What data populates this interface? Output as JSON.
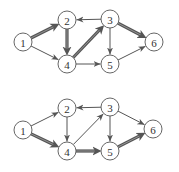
{
  "node_radius": 9,
  "colors": {
    "stroke": "#555555",
    "text": "#333333",
    "background": "#ffffff"
  },
  "graphs": [
    {
      "id": "top",
      "nodes": [
        {
          "id": "1",
          "label": "1",
          "x": 23,
          "y": 42
        },
        {
          "id": "2",
          "label": "2",
          "x": 67,
          "y": 20
        },
        {
          "id": "3",
          "label": "3",
          "x": 110,
          "y": 19
        },
        {
          "id": "4",
          "label": "4",
          "x": 67,
          "y": 64
        },
        {
          "id": "5",
          "label": "5",
          "x": 110,
          "y": 64
        },
        {
          "id": "6",
          "label": "6",
          "x": 154,
          "y": 42
        }
      ],
      "edges": [
        {
          "from": "1",
          "to": "2",
          "highlighted": true
        },
        {
          "from": "1",
          "to": "4",
          "highlighted": false
        },
        {
          "from": "2",
          "to": "4",
          "highlighted": true
        },
        {
          "from": "3",
          "to": "2",
          "highlighted": false
        },
        {
          "from": "4",
          "to": "3",
          "highlighted": true
        },
        {
          "from": "3",
          "to": "5",
          "highlighted": false
        },
        {
          "from": "3",
          "to": "6",
          "highlighted": true
        },
        {
          "from": "4",
          "to": "5",
          "highlighted": false
        },
        {
          "from": "5",
          "to": "6",
          "highlighted": false
        }
      ]
    },
    {
      "id": "bottom",
      "nodes": [
        {
          "id": "1",
          "label": "1",
          "x": 23,
          "y": 130
        },
        {
          "id": "2",
          "label": "2",
          "x": 67,
          "y": 108
        },
        {
          "id": "3",
          "label": "3",
          "x": 110,
          "y": 107
        },
        {
          "id": "4",
          "label": "4",
          "x": 67,
          "y": 151
        },
        {
          "id": "5",
          "label": "5",
          "x": 110,
          "y": 151
        },
        {
          "id": "6",
          "label": "6",
          "x": 153,
          "y": 129
        }
      ],
      "edges": [
        {
          "from": "1",
          "to": "2",
          "highlighted": false
        },
        {
          "from": "1",
          "to": "4",
          "highlighted": true
        },
        {
          "from": "2",
          "to": "4",
          "highlighted": false
        },
        {
          "from": "3",
          "to": "2",
          "highlighted": false
        },
        {
          "from": "4",
          "to": "3",
          "highlighted": false
        },
        {
          "from": "3",
          "to": "5",
          "highlighted": false
        },
        {
          "from": "3",
          "to": "6",
          "highlighted": false
        },
        {
          "from": "4",
          "to": "5",
          "highlighted": true
        },
        {
          "from": "5",
          "to": "6",
          "highlighted": true
        }
      ]
    }
  ]
}
